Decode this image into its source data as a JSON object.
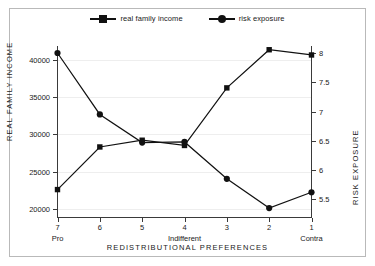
{
  "legend": {
    "items": [
      {
        "label": "real family income",
        "marker": "square-marker",
        "color": "#111111"
      },
      {
        "label": "risk exposure",
        "marker": "circle-marker",
        "color": "#111111"
      }
    ]
  },
  "axes": {
    "left_title": "REAL FAMILY INCOME",
    "right_title": "RISK EXPOSURE",
    "x_title": "REDISTRIBUTIONAL PREFERENCES",
    "left_ticks": [
      "20000",
      "25000",
      "30000",
      "35000",
      "40000"
    ],
    "right_ticks": [
      "5.5",
      "6",
      "6.5",
      "7",
      "7.5",
      "8"
    ],
    "x_ticks": [
      "7",
      "6",
      "5",
      "4",
      "3",
      "2",
      "1"
    ],
    "x_sublabels": {
      "7": "Pro",
      "4": "Indifferent",
      "1": "Contra"
    }
  },
  "chart_data": {
    "type": "line",
    "title": "",
    "xlabel": "REDISTRIBUTIONAL PREFERENCES",
    "ylabel": "REAL FAMILY INCOME",
    "y2label": "RISK EXPOSURE",
    "categories": [
      "7",
      "6",
      "5",
      "4",
      "3",
      "2",
      "1"
    ],
    "category_annotations": [
      "Pro",
      "",
      "",
      "Indifferent",
      "",
      "",
      "Contra"
    ],
    "grid": true,
    "legend_position": "top-center",
    "ylim": [
      18800,
      41800
    ],
    "y2lim": [
      5.18,
      8.12
    ],
    "yticks": [
      20000,
      25000,
      30000,
      35000,
      40000
    ],
    "y2ticks": [
      5.5,
      6,
      6.5,
      7,
      7.5,
      8
    ],
    "series": [
      {
        "name": "real family income",
        "axis": "left",
        "marker": "square",
        "values": [
          22600,
          28300,
          29200,
          28500,
          36200,
          41300,
          40600
        ]
      },
      {
        "name": "risk exposure",
        "axis": "right",
        "marker": "circle",
        "values": [
          8.0,
          6.95,
          6.47,
          6.48,
          5.85,
          5.35,
          5.62
        ]
      }
    ]
  }
}
